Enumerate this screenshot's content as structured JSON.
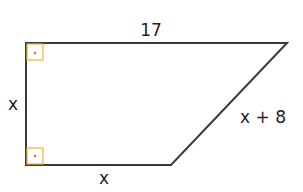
{
  "figure": {
    "type": "right trapezoid",
    "labels": {
      "top": "17",
      "left": "x",
      "bottom": "x",
      "slant": "x + 8"
    },
    "right_angle_markers": [
      "top-left",
      "bottom-left"
    ],
    "colors": {
      "stroke": "#3a3a3a",
      "right_angle_marker": "#f2b035",
      "marker_dot": "#d9792a",
      "text": "#1e1e1e",
      "background": "#ffffff"
    }
  }
}
